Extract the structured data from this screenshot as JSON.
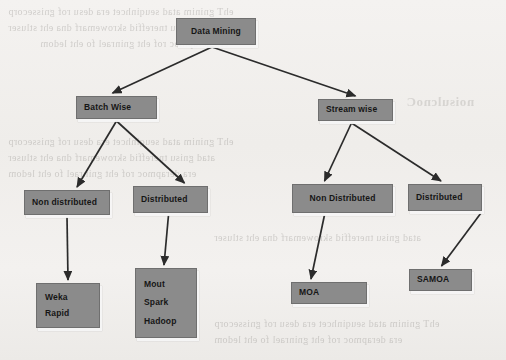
{
  "page": {
    "background_color": "#f1efec",
    "node_fill_color": "#8b8b8b",
    "node_border_color": "#6f6f6f",
    "text_color": "#161616",
    "connector_color": "#2b2b2b"
  },
  "diagram": {
    "root": {
      "id": "data-mining",
      "label": "Data Mining",
      "x": 176,
      "y": 18,
      "w": 80,
      "h": 27
    },
    "level2": [
      {
        "id": "batch-wise",
        "label": "Batch Wise",
        "x": 76,
        "y": 96,
        "w": 81,
        "h": 23
      },
      {
        "id": "stream-wise",
        "label": "Stream wise",
        "x": 318,
        "y": 99,
        "w": 75,
        "h": 22
      }
    ],
    "level3": [
      {
        "id": "batch-non-distributed",
        "label": "Non distributed",
        "x": 24,
        "y": 190,
        "w": 86,
        "h": 25
      },
      {
        "id": "batch-distributed",
        "label": "Distributed",
        "x": 133,
        "y": 186,
        "w": 75,
        "h": 27
      },
      {
        "id": "stream-non-distributed",
        "label": "Non Distributed",
        "x": 292,
        "y": 184,
        "w": 101,
        "h": 29
      },
      {
        "id": "stream-distributed",
        "label": "Distributed",
        "x": 408,
        "y": 184,
        "w": 74,
        "h": 27
      }
    ],
    "leaves": [
      {
        "id": "weka-rapid",
        "lines": [
          "Weka",
          "Rapid"
        ],
        "x": 36,
        "y": 283,
        "w": 64,
        "h": 45
      },
      {
        "id": "mout-spark-hadoop",
        "lines": [
          "Mout",
          "Spark",
          "Hadoop"
        ],
        "x": 135,
        "y": 268,
        "w": 62,
        "h": 70
      },
      {
        "id": "moa",
        "lines": [
          "MOA"
        ],
        "x": 291,
        "y": 282,
        "w": 76,
        "h": 22
      },
      {
        "id": "samoa",
        "lines": [
          "SAMOA"
        ],
        "x": 409,
        "y": 269,
        "w": 63,
        "h": 22
      }
    ],
    "edges": [
      {
        "id": "edge-root-batch",
        "from": "data-mining",
        "to": "batch-wise"
      },
      {
        "id": "edge-root-stream",
        "from": "data-mining",
        "to": "stream-wise"
      },
      {
        "id": "edge-batch-nondist",
        "from": "batch-wise",
        "to": "batch-non-distributed"
      },
      {
        "id": "edge-batch-dist",
        "from": "batch-wise",
        "to": "batch-distributed"
      },
      {
        "id": "edge-stream-nondist",
        "from": "stream-wise",
        "to": "stream-non-distributed"
      },
      {
        "id": "edge-stream-dist",
        "from": "stream-wise",
        "to": "stream-distributed"
      },
      {
        "id": "edge-batch-nondist-leaf",
        "from": "batch-non-distributed",
        "to": "weka-rapid"
      },
      {
        "id": "edge-batch-dist-leaf",
        "from": "batch-distributed",
        "to": "mout-spark-hadoop"
      },
      {
        "id": "edge-stream-nondist-leaf",
        "from": "stream-non-distributed",
        "to": "moa"
      },
      {
        "id": "edge-stream-dist-leaf",
        "from": "stream-distributed",
        "to": "samoa"
      }
    ]
  },
  "background_bleed": {
    "note": "mirrored show-through text from the reverse side of the scanned page",
    "heading": "noisulcnoC",
    "lines": [
      "ehT gninim atad seuqinhcet era desu rof gnissecorp",
      "atad gnisu tnereffid skrowemarf dna eht stluser",
      "era derapmoc rof eht gninrael fo eht ledom"
    ]
  }
}
